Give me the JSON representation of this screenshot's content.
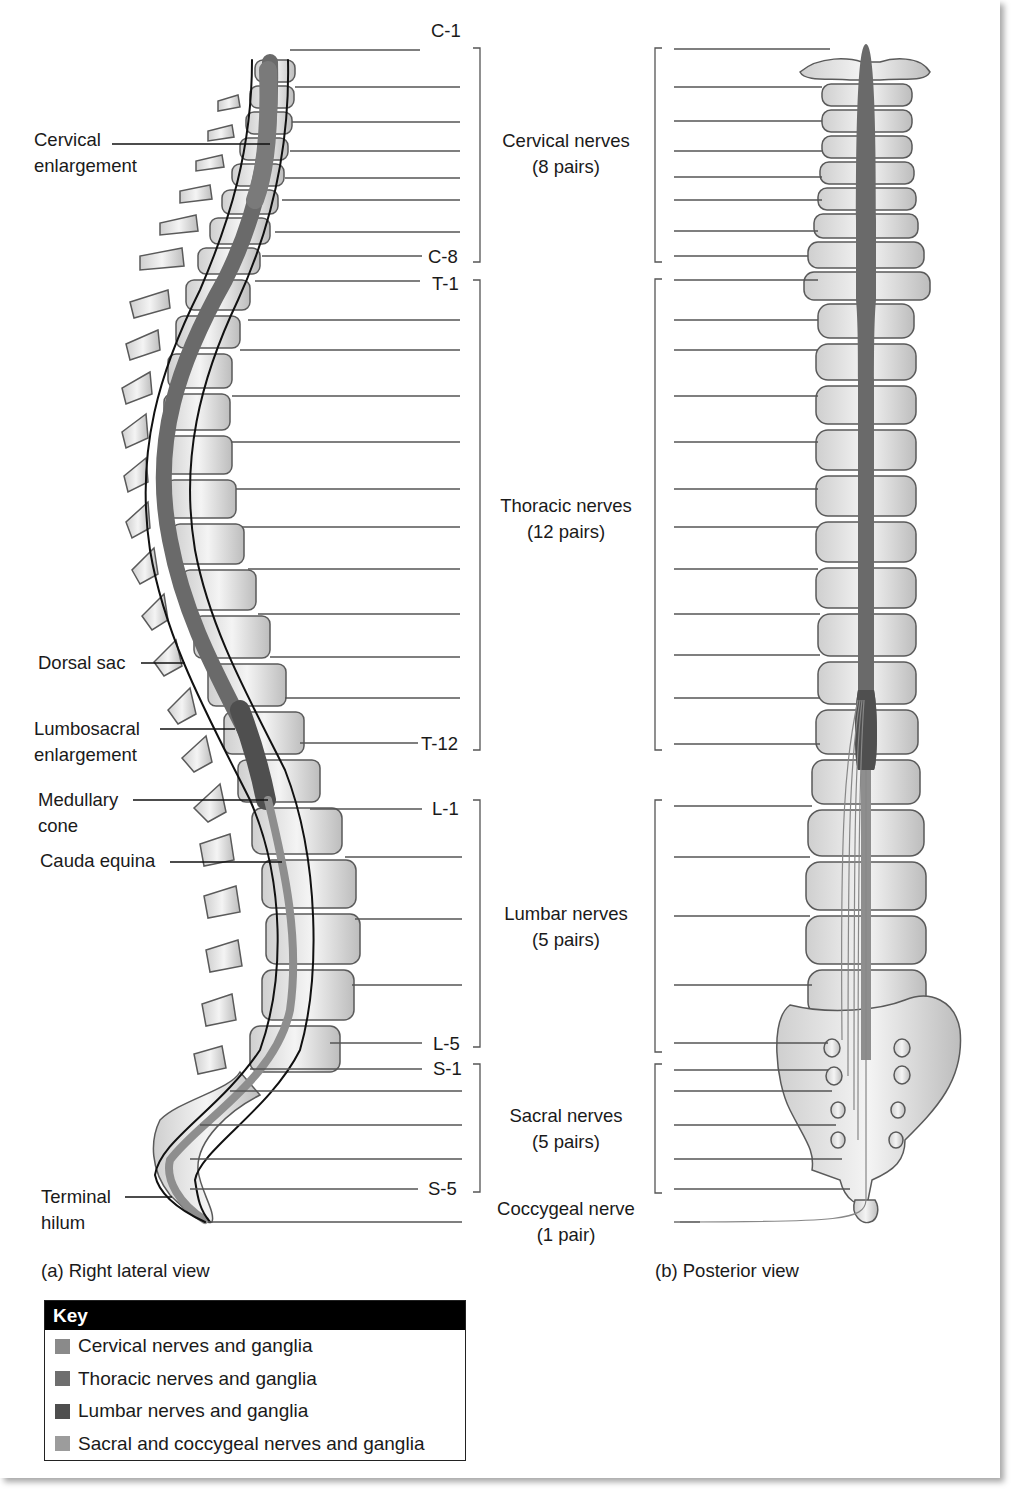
{
  "left_view": {
    "caption": "(a) Right lateral view",
    "annotations": [
      {
        "id": "cervical-enlargement",
        "lines": [
          "Cervical",
          "enlargement"
        ]
      },
      {
        "id": "dorsal-sac",
        "lines": [
          "Dorsal sac"
        ]
      },
      {
        "id": "lumbosacral-enlargement",
        "lines": [
          "Lumbosacral",
          "enlargement"
        ]
      },
      {
        "id": "medullary-cone",
        "lines": [
          "Medullary",
          "cone"
        ]
      },
      {
        "id": "cauda-equina",
        "lines": [
          "Cauda equina"
        ]
      },
      {
        "id": "terminal-hilum",
        "lines": [
          "Terminal",
          "hilum"
        ]
      }
    ]
  },
  "right_view": {
    "caption": "(b) Posterior view"
  },
  "segment_labels": {
    "c1": "C-1",
    "c8": "C-8",
    "t1": "T-1",
    "t12": "T-12",
    "l1": "L-1",
    "l5": "L-5",
    "s1": "S-1",
    "s5": "S-5"
  },
  "nerve_groups": [
    {
      "name": "Cervical nerves",
      "count": "(8 pairs)"
    },
    {
      "name": "Thoracic nerves",
      "count": "(12 pairs)"
    },
    {
      "name": "Lumbar nerves",
      "count": "(5 pairs)"
    },
    {
      "name": "Sacral nerves",
      "count": "(5 pairs)"
    },
    {
      "name": "Coccygeal nerve",
      "count": "(1 pair)"
    }
  ],
  "key": {
    "title": "Key",
    "items": [
      {
        "label": "Cervical nerves and ganglia",
        "color": "#8a8a8a"
      },
      {
        "label": "Thoracic nerves and ganglia",
        "color": "#6e6e6e"
      },
      {
        "label": "Lumbar nerves and ganglia",
        "color": "#4e4e4e"
      },
      {
        "label": "Sacral and coccygeal nerves and ganglia",
        "color": "#9c9c9c"
      }
    ]
  },
  "colors": {
    "cord_cervical": "#7a7a7a",
    "cord_thoracic": "#6a6a6a",
    "cord_lumbar": "#4f4f4f",
    "cord_sacral": "#8e8e8e",
    "bone_fill": "#e6e6e6",
    "bone_stroke": "#5a5a5a",
    "leader": "#555555"
  }
}
